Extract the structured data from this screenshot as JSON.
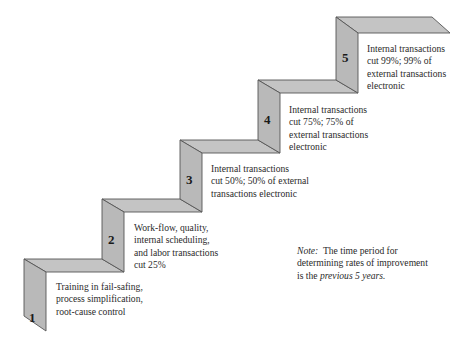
{
  "diagram": {
    "type": "staircase",
    "colors": {
      "face": "#b9b9b9",
      "tread": "#c4c4c4",
      "edge": "#555555",
      "text": "#2a2a2a"
    },
    "steps": [
      {
        "number": "1",
        "lines": [
          "Training in fail-safing,",
          "process simplification,",
          "root-cause control"
        ]
      },
      {
        "number": "2",
        "lines": [
          "Work-flow, quality,",
          "internal scheduling,",
          "and labor transactions",
          "cut 25%"
        ]
      },
      {
        "number": "3",
        "lines": [
          "Internal transactions",
          "cut 50%; 50% of external",
          "transactions electronic"
        ]
      },
      {
        "number": "4",
        "lines": [
          "Internal transactions",
          "cut 75%; 75% of",
          "external transactions",
          "electronic"
        ]
      },
      {
        "number": "5",
        "lines": [
          "Internal transactions",
          "cut 99%; 99% of",
          "external transactions",
          "electronic"
        ]
      }
    ],
    "note": {
      "label": "Note:",
      "text_before": "The time period for",
      "line2": "determining rates of improvement",
      "line3_prefix": "is the",
      "line3_italic": "previous 5 years."
    }
  }
}
